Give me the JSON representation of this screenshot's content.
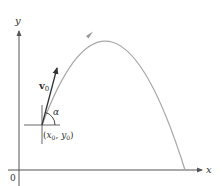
{
  "diagram": {
    "axes": {
      "x_label": "x",
      "y_label": "y",
      "origin_label": "0"
    },
    "launch_point": {
      "label_open": "(",
      "x_sym": "x",
      "x_sub": "0",
      "comma": ", ",
      "y_sym": "y",
      "y_sub": "0",
      "label_close": ")"
    },
    "velocity_vector": {
      "symbol": "v",
      "subscript": "0"
    },
    "angle": {
      "symbol": "α"
    },
    "colors": {
      "axis": "#555555",
      "trajectory": "#a8a8a8",
      "vector": "#333333",
      "text": "#333333",
      "background": "#ffffff"
    }
  }
}
